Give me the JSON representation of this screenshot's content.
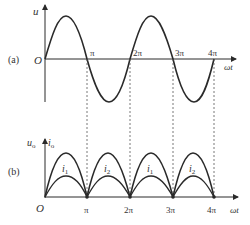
{
  "figure": {
    "panel_a": {
      "tag": "(a)",
      "y_axis_label": "u",
      "x_axis_label": "ωt",
      "origin_label": "O",
      "ticks": [
        "π",
        "2π",
        "3π",
        "4π"
      ],
      "curve": "sine wave, two full periods from 0 to 4π"
    },
    "panel_b": {
      "tag": "(b)",
      "y_axis_label_1": "u",
      "y_axis_label_1_sub": "o",
      "y_axis_label_2": "i",
      "y_axis_label_2_sub": "o",
      "x_axis_label": "ωt",
      "origin_label": "O",
      "ticks": [
        "π",
        "2π",
        "3π",
        "4π"
      ],
      "half_wave_labels": [
        {
          "text": "i",
          "sub": "1"
        },
        {
          "text": "i",
          "sub": "2"
        },
        {
          "text": "i",
          "sub": "1"
        },
        {
          "text": "i",
          "sub": "2"
        }
      ],
      "curves": "full-wave rectified output: voltage (tall arches) and current (short arches) over 0 to 4π"
    },
    "colors": {
      "line": "#2a2a2a",
      "text": "#333333",
      "dashed": "#555555"
    }
  }
}
